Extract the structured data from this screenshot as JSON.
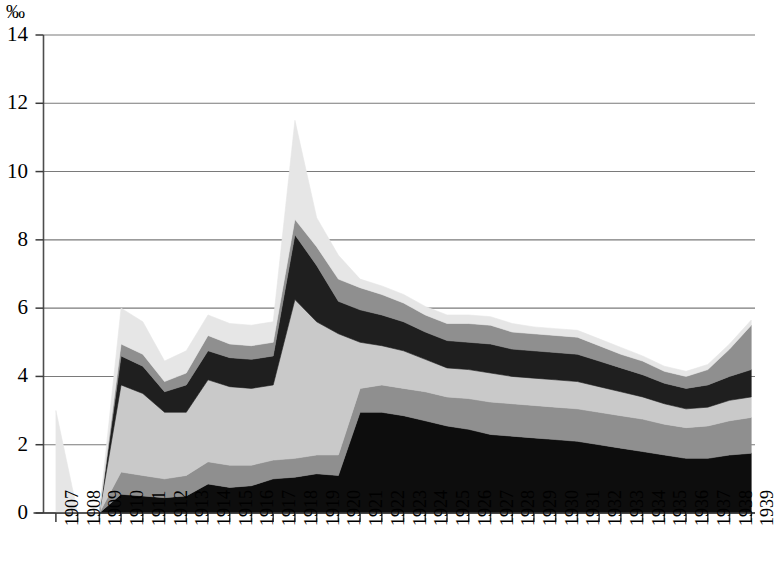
{
  "chart_data": {
    "type": "area",
    "stacked": true,
    "title": "",
    "subtitle": "",
    "xlabel": "",
    "ylabel": "‰",
    "unit_label": "‰",
    "grid": true,
    "grid_orientation": "horizontal",
    "legend_position": "none",
    "ylim": [
      0,
      14
    ],
    "ytick_labels": [
      "0",
      "2",
      "4",
      "6",
      "8",
      "10",
      "12",
      "14"
    ],
    "ytick_values": [
      0,
      2,
      4,
      6,
      8,
      10,
      12,
      14
    ],
    "x": [
      1907,
      1908,
      1909,
      1910,
      1911,
      1912,
      1913,
      1914,
      1915,
      1916,
      1917,
      1918,
      1919,
      1920,
      1921,
      1922,
      1923,
      1924,
      1925,
      1926,
      1927,
      1928,
      1929,
      1930,
      1931,
      1932,
      1933,
      1934,
      1935,
      1936,
      1937,
      1938,
      1939
    ],
    "categories": [
      "1907",
      "1908",
      "1909",
      "1910",
      "1911",
      "1912",
      "1913",
      "1914",
      "1915",
      "1916",
      "1917",
      "1918",
      "1919",
      "1920",
      "1921",
      "1922",
      "1923",
      "1924",
      "1925",
      "1926",
      "1927",
      "1928",
      "1929",
      "1930",
      "1931",
      "1932",
      "1933",
      "1934",
      "1935",
      "1936",
      "1937",
      "1938",
      "1939"
    ],
    "series": [
      {
        "name": "series-1",
        "color": "#0d0d0d",
        "values": [
          0.0,
          0.0,
          0.0,
          0.55,
          0.5,
          0.45,
          0.5,
          0.85,
          0.75,
          0.8,
          1.0,
          1.05,
          1.15,
          1.1,
          2.95,
          2.95,
          2.85,
          2.7,
          2.55,
          2.45,
          2.3,
          2.25,
          2.2,
          2.15,
          2.1,
          2.0,
          1.9,
          1.8,
          1.7,
          1.6,
          1.6,
          1.7,
          1.75
        ]
      },
      {
        "name": "series-2",
        "color": "#8f8f8f",
        "values": [
          0.0,
          0.0,
          0.0,
          0.65,
          0.6,
          0.55,
          0.6,
          0.65,
          0.65,
          0.6,
          0.55,
          0.55,
          0.55,
          0.6,
          0.7,
          0.8,
          0.8,
          0.85,
          0.85,
          0.9,
          0.95,
          0.95,
          0.95,
          0.95,
          0.95,
          0.95,
          0.95,
          0.95,
          0.9,
          0.9,
          0.95,
          1.0,
          1.05
        ]
      },
      {
        "name": "series-3",
        "color": "#c9c9c9",
        "values": [
          0.0,
          0.0,
          0.0,
          2.55,
          2.4,
          1.95,
          1.85,
          2.4,
          2.3,
          2.25,
          2.2,
          4.65,
          3.9,
          3.55,
          1.35,
          1.15,
          1.1,
          0.95,
          0.85,
          0.85,
          0.85,
          0.8,
          0.8,
          0.8,
          0.8,
          0.75,
          0.7,
          0.65,
          0.6,
          0.55,
          0.55,
          0.6,
          0.6
        ]
      },
      {
        "name": "series-4",
        "color": "#1f1f1f",
        "values": [
          0.0,
          0.0,
          0.0,
          0.85,
          0.8,
          0.6,
          0.8,
          0.85,
          0.85,
          0.85,
          0.85,
          1.9,
          1.65,
          0.95,
          0.95,
          0.9,
          0.85,
          0.8,
          0.8,
          0.8,
          0.85,
          0.8,
          0.8,
          0.8,
          0.8,
          0.75,
          0.7,
          0.65,
          0.6,
          0.6,
          0.65,
          0.7,
          0.8
        ]
      },
      {
        "name": "series-5",
        "color": "#8f8f8f",
        "values": [
          0.0,
          0.0,
          0.0,
          0.35,
          0.35,
          0.3,
          0.35,
          0.45,
          0.4,
          0.4,
          0.4,
          0.45,
          0.55,
          0.65,
          0.65,
          0.6,
          0.55,
          0.5,
          0.5,
          0.55,
          0.55,
          0.5,
          0.5,
          0.5,
          0.5,
          0.45,
          0.4,
          0.4,
          0.35,
          0.35,
          0.45,
          0.8,
          1.3
        ]
      },
      {
        "name": "series-6",
        "color": "#e6e6e6",
        "values": [
          3.0,
          0.0,
          0.0,
          1.05,
          0.95,
          0.6,
          0.65,
          0.6,
          0.6,
          0.6,
          0.6,
          2.9,
          0.85,
          0.7,
          0.25,
          0.25,
          0.25,
          0.25,
          0.25,
          0.25,
          0.25,
          0.25,
          0.2,
          0.2,
          0.2,
          0.2,
          0.2,
          0.15,
          0.15,
          0.15,
          0.15,
          0.15,
          0.15
        ]
      }
    ],
    "totals": [
      3.0,
      0.0,
      0.0,
      6.0,
      5.6,
      4.45,
      4.75,
      5.8,
      5.55,
      5.5,
      5.6,
      11.5,
      8.65,
      7.55,
      6.85,
      6.65,
      6.4,
      6.05,
      5.8,
      5.8,
      5.75,
      5.55,
      5.45,
      5.4,
      5.35,
      5.1,
      4.85,
      4.6,
      4.3,
      4.15,
      4.35,
      4.95,
      5.65
    ],
    "annotations": {
      "peak_year": "1918",
      "peak_value": "11.5"
    },
    "axis_color": "#4d4d4d",
    "grid_color": "#7a7a7a"
  }
}
